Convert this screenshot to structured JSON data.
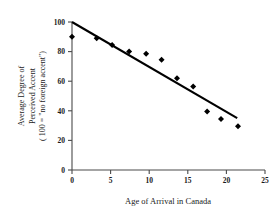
{
  "chart_data": {
    "type": "scatter",
    "title": "",
    "subtitle": "",
    "xlabel": "Age of Arrival in Canada",
    "ylabel_lines": [
      "Average Degree of",
      "Perceived Accent",
      "( 100 = \"no foreign accent\")"
    ],
    "ylabel": "Average Degree of Perceived Accent ( 100 = \"no foreign accent\")",
    "xlim": [
      0,
      25
    ],
    "ylim": [
      0,
      100
    ],
    "xticks": [
      0,
      5,
      10,
      15,
      20,
      25
    ],
    "xtick_labels": [
      "0",
      "5",
      "10",
      "15",
      "20",
      "25"
    ],
    "yticks": [
      0,
      20,
      40,
      60,
      80,
      100
    ],
    "ytick_labels": [
      "0",
      "20",
      "40",
      "60",
      "80",
      "100"
    ],
    "grid": false,
    "legend": false,
    "legend_position": "none",
    "marker": "filled-diamond",
    "marker_color": "#000000",
    "line_color": "#000000",
    "x": [
      0,
      3.2,
      5.2,
      7.4,
      9.6,
      11.6,
      13.6,
      15.7,
      17.5,
      19.3,
      21.5
    ],
    "y": [
      90,
      89,
      84.5,
      80,
      78.5,
      74.5,
      62,
      56.5,
      39.5,
      34.5,
      29.5
    ],
    "points": [
      {
        "x": 0,
        "y": 90
      },
      {
        "x": 3.2,
        "y": 89
      },
      {
        "x": 5.2,
        "y": 84.5
      },
      {
        "x": 7.4,
        "y": 80
      },
      {
        "x": 9.6,
        "y": 78.5
      },
      {
        "x": 11.6,
        "y": 74.5
      },
      {
        "x": 13.6,
        "y": 62
      },
      {
        "x": 15.7,
        "y": 56.5
      },
      {
        "x": 17.5,
        "y": 39.5
      },
      {
        "x": 19.3,
        "y": 34.5
      },
      {
        "x": 21.5,
        "y": 29.5
      }
    ],
    "trend": {
      "name": "regression-line",
      "x0": 0,
      "y0": 100,
      "x1": 21.4,
      "y1": 35
    },
    "annotations": []
  }
}
